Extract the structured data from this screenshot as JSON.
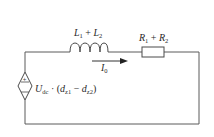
{
  "diagram": {
    "type": "circuit",
    "colors": {
      "wire": "#5a5a5a",
      "background": "#ffffff",
      "text": "#2a2a2a"
    },
    "inductor": {
      "label_parts": [
        "L",
        "1",
        " + ",
        "L",
        "2"
      ],
      "label": "L1 + L2"
    },
    "resistor": {
      "label_parts": [
        "R",
        "1",
        " + ",
        "R",
        "2"
      ],
      "label": "R1 + R2"
    },
    "current": {
      "label_parts": [
        "I",
        "0"
      ],
      "label": "I0",
      "direction": "right"
    },
    "source": {
      "type": "dependent-voltage-source",
      "polarity_top": "+",
      "polarity_bottom": "−",
      "label_parts": [
        "U",
        "dc",
        " · (",
        "d",
        "z1",
        " − ",
        "d",
        "z2",
        ")"
      ],
      "label": "Udc · (dz1 − dz2)"
    }
  }
}
